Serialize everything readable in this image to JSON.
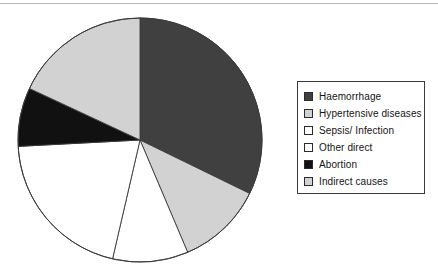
{
  "chart_data": {
    "type": "pie",
    "title": "",
    "subtitle": "",
    "xlabel": "",
    "ylabel": "",
    "grid": false,
    "legend_position": "right",
    "start_angle_deg": 0,
    "direction": "clockwise",
    "categories": [
      "Haemorrhage",
      "Hypertensive diseases",
      "Sepsis/ Infection",
      "Other direct",
      "Abortion",
      "Indirect causes"
    ],
    "values": [
      32.2,
      11.4,
      10.0,
      20.6,
      7.8,
      18.0
    ],
    "slice_colors": [
      "#404040",
      "#d2d2d2",
      "#ffffff",
      "#ffffff",
      "#111111",
      "#d2d2d2"
    ],
    "boundary_angles_deg": [
      0,
      116,
      157,
      193,
      267,
      295,
      360
    ],
    "slices": [
      {
        "label": "Haemorrhage",
        "value": 32.2,
        "color": "#404040",
        "start_deg": 0,
        "end_deg": 116
      },
      {
        "label": "Hypertensive diseases",
        "value": 11.4,
        "color": "#d2d2d2",
        "start_deg": 116,
        "end_deg": 157
      },
      {
        "label": "Sepsis/ Infection",
        "value": 10.0,
        "color": "#ffffff",
        "start_deg": 157,
        "end_deg": 193
      },
      {
        "label": "Other direct",
        "value": 20.6,
        "color": "#ffffff",
        "start_deg": 193,
        "end_deg": 267
      },
      {
        "label": "Abortion",
        "value": 7.8,
        "color": "#111111",
        "start_deg": 267,
        "end_deg": 295
      },
      {
        "label": "Indirect causes",
        "value": 18.0,
        "color": "#d2d2d2",
        "start_deg": 295,
        "end_deg": 360
      }
    ]
  },
  "legend": {
    "items": [
      {
        "label": "Haemorrhage",
        "color": "#404040"
      },
      {
        "label": "Hypertensive diseases",
        "color": "#d2d2d2"
      },
      {
        "label": "Sepsis/ Infection",
        "color": "#ffffff"
      },
      {
        "label": "Other direct",
        "color": "#ffffff"
      },
      {
        "label": "Abortion",
        "color": "#111111"
      },
      {
        "label": "Indirect causes",
        "color": "#d2d2d2"
      }
    ]
  },
  "colors": {
    "outline": "#3a3a3a",
    "background": "#ffffff",
    "dark_gray": "#404040",
    "light_gray": "#d2d2d2",
    "black": "#111111",
    "white": "#ffffff"
  }
}
